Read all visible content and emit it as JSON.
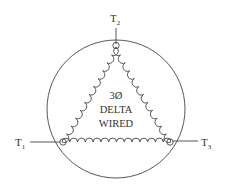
{
  "diagram": {
    "title_lines": [
      "3Ø",
      "DELTA",
      "WIRED"
    ],
    "terminals": [
      {
        "id": "T1",
        "main": "T",
        "sub": "1",
        "position": "left"
      },
      {
        "id": "T2",
        "main": "T",
        "sub": "2",
        "position": "top"
      },
      {
        "id": "T3",
        "main": "T",
        "sub": "3",
        "position": "right"
      }
    ],
    "winding_shape": "triangle-coils",
    "enclosure": "circle",
    "colors": {
      "line": "#444444",
      "background": "#ffffff",
      "text": "#333333"
    }
  }
}
